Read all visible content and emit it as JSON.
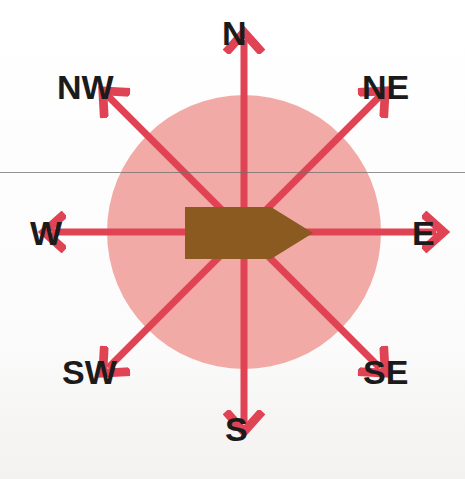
{
  "figure": {
    "background_color": "#ffffff"
  },
  "compass": {
    "center": {
      "x": 244,
      "y": 232
    },
    "disc": {
      "name": "pink-circle",
      "radius": 137,
      "fill_color": "#f2aaa6"
    },
    "center_marker": {
      "name": "brown-arrow-shape",
      "fill_color": "#8a5a20",
      "points_toward": "E",
      "left": 185,
      "top": 207,
      "width": 128,
      "height": 52,
      "notch_depth": 42
    },
    "arrow_color": "#e04353",
    "arrow_stroke_width": 7,
    "arrow_length": 192,
    "directions": [
      {
        "key": "N",
        "label": "N",
        "angle_deg": 0,
        "label_x": 222,
        "label_y": 16
      },
      {
        "key": "NE",
        "label": "NE",
        "angle_deg": 45,
        "label_x": 362,
        "label_y": 70
      },
      {
        "key": "E",
        "label": "E",
        "angle_deg": 90,
        "label_x": 412,
        "label_y": 216
      },
      {
        "key": "SE",
        "label": "SE",
        "angle_deg": 135,
        "label_x": 363,
        "label_y": 355
      },
      {
        "key": "S",
        "label": "S",
        "angle_deg": 180,
        "label_x": 225,
        "label_y": 412
      },
      {
        "key": "SW",
        "label": "SW",
        "angle_deg": 225,
        "label_x": 62,
        "label_y": 355
      },
      {
        "key": "W",
        "label": "W",
        "angle_deg": 270,
        "label_x": 30,
        "label_y": 216
      },
      {
        "key": "NW",
        "label": "NW",
        "angle_deg": 315,
        "label_x": 57,
        "label_y": 70
      }
    ]
  },
  "annotations": {
    "scan_line": {
      "name": "horizontal-scan-line",
      "y": 172,
      "color": "#6f6f6f"
    }
  },
  "chart_data": {
    "type": "scatter",
    "xlabel": "",
    "ylabel": "",
    "categories": [
      "N",
      "NE",
      "E",
      "SE",
      "S",
      "SW",
      "W",
      "NW"
    ],
    "values": [
      0,
      45,
      90,
      135,
      180,
      225,
      270,
      315
    ],
    "annotations": [
      "Center marker arrow points East"
    ],
    "legend_position": "none",
    "grid": false
  }
}
